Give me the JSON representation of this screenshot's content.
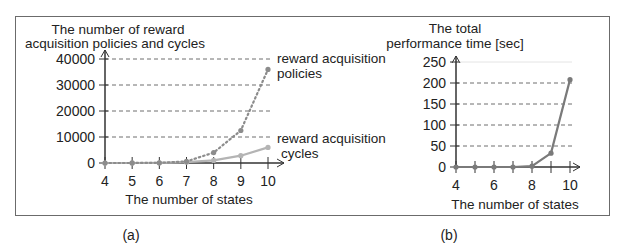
{
  "figure": {
    "panel_a_label": "(a)",
    "panel_b_label": "(b)"
  },
  "chart_data": [
    {
      "type": "line",
      "panel": "(a)",
      "title": "",
      "ylabel_line1": "The number of reward",
      "ylabel_line2": "acquisition policies and cycles",
      "xlabel": "The number of states",
      "x": [
        4,
        5,
        6,
        7,
        8,
        9,
        10
      ],
      "yticks": [
        0,
        10000,
        20000,
        30000,
        40000
      ],
      "ylim": [
        0,
        40000
      ],
      "grid": "horizontal dashed",
      "series": [
        {
          "name": "reward acquisition policies",
          "label_line1": "reward acquisition",
          "label_line2": "policies",
          "style": "dotted",
          "color": "#8c8c8c",
          "values": [
            0,
            10,
            60,
            600,
            4000,
            12500,
            36000
          ]
        },
        {
          "name": "reward acquisition cycles",
          "label_line1": "reward acquisition",
          "label_line2": "cycles",
          "style": "solid",
          "color": "#b4b4b4",
          "values": [
            0,
            5,
            30,
            300,
            1000,
            2800,
            6000
          ]
        }
      ]
    },
    {
      "type": "line",
      "panel": "(b)",
      "title": "",
      "ylabel_line1": "The total",
      "ylabel_line2": "performance time [sec]",
      "xlabel": "The number of states",
      "x": [
        4,
        5,
        6,
        7,
        8,
        9,
        10
      ],
      "xticklabels": [
        "4",
        "6",
        "8",
        "10"
      ],
      "yticks": [
        0,
        50,
        100,
        150,
        200,
        250
      ],
      "ylim": [
        0,
        250
      ],
      "grid": "horizontal dashed",
      "series": [
        {
          "name": "total performance time",
          "style": "solid",
          "color": "#7a7a7a",
          "values": [
            0,
            0,
            0,
            0,
            2,
            33,
            208
          ]
        }
      ]
    }
  ]
}
